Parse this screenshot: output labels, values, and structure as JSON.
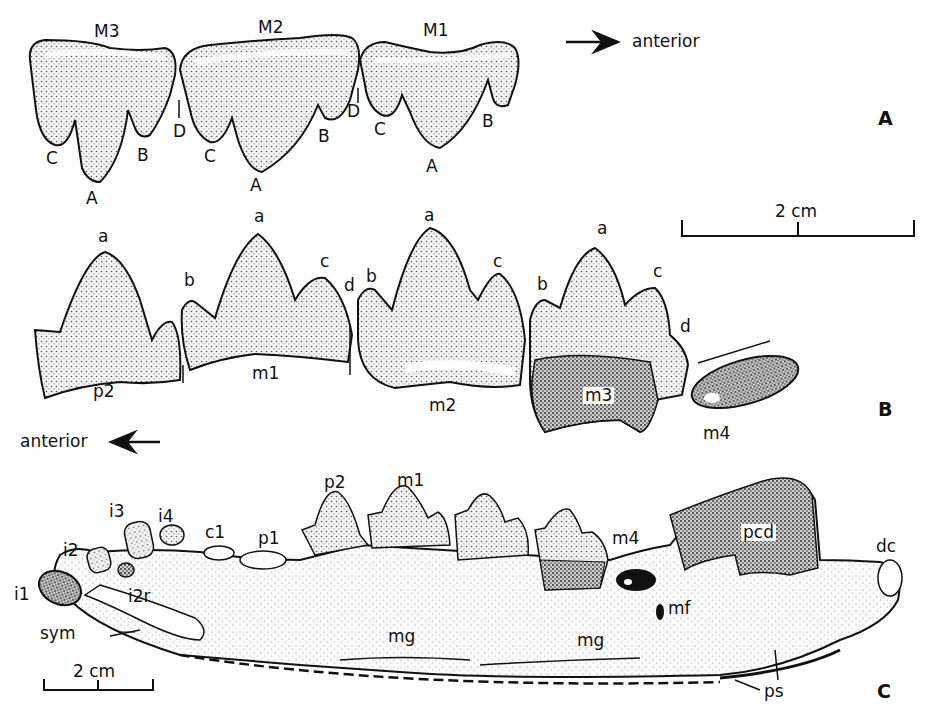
{
  "figure": {
    "panels": [
      {
        "id": "A",
        "label": "A",
        "direction_label": "anterior",
        "direction": "right",
        "teeth": [
          "M3",
          "M2",
          "M1"
        ],
        "cusps": {
          "M3": [
            "C",
            "A",
            "B"
          ],
          "M2": [
            "D",
            "C",
            "A",
            "B"
          ],
          "M1": [
            "D",
            "C",
            "A",
            "B"
          ]
        }
      },
      {
        "id": "B",
        "label": "B",
        "direction_label": "anterior",
        "direction": "left",
        "teeth": [
          "p2",
          "m1",
          "m2",
          "m3",
          "m4"
        ],
        "cusps": {
          "p2": [
            "a"
          ],
          "m1": [
            "b",
            "a",
            "c",
            "d"
          ],
          "m2": [
            "b",
            "a",
            "c"
          ],
          "m3": [
            "b",
            "a",
            "c",
            "d"
          ]
        }
      },
      {
        "id": "C",
        "label": "C",
        "structures": [
          "i1",
          "i2",
          "i2r",
          "i3",
          "i4",
          "c1",
          "p1",
          "p2",
          "m1",
          "m4",
          "sym",
          "mg",
          "mg",
          "mf",
          "pcd",
          "dc",
          "ps"
        ]
      }
    ],
    "scale_bars": [
      {
        "label": "2 cm",
        "panel": "A-B"
      },
      {
        "label": "2 cm",
        "panel": "C"
      }
    ]
  },
  "labels": {
    "A": "A",
    "B": "B",
    "C": "C",
    "anterior_top": "anterior",
    "anterior_mid": "anterior",
    "scale_top": "2 cm",
    "scale_bottom": "2 cm",
    "M3": "M3",
    "M2": "M2",
    "M1": "M1",
    "a_cuspA": "A",
    "a_cuspB": "B",
    "a_cuspC": "C",
    "a_cuspD": "D",
    "b_a": "a",
    "b_b": "b",
    "b_c": "c",
    "b_d": "d",
    "p2": "p2",
    "m1": "m1",
    "m2": "m2",
    "m3": "m3",
    "m4": "m4",
    "i1": "i1",
    "i2": "i2",
    "i2r": "i2r",
    "i3": "i3",
    "i4": "i4",
    "c1": "c1",
    "p1": "p1",
    "sym": "sym",
    "mg": "mg",
    "mf": "mf",
    "pcd": "pcd",
    "dc": "dc",
    "ps": "ps"
  }
}
